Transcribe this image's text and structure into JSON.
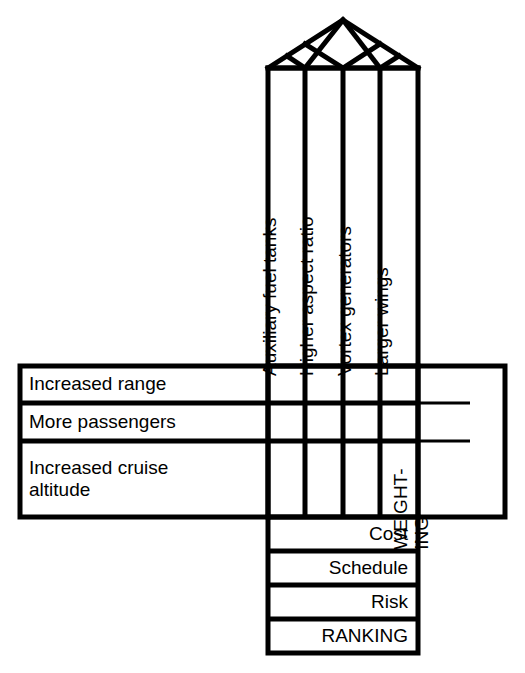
{
  "diagram": {
    "type": "house-of-quality",
    "title": "",
    "roof": {
      "name": "correlation-roof",
      "cells_empty": true,
      "diamond_count": 6
    },
    "columns": {
      "header": "",
      "items": [
        {
          "label": "Auxiliary fuel tanks"
        },
        {
          "label": "Higher aspect ratio"
        },
        {
          "label": "Vortex generators"
        },
        {
          "label": "Larger wings"
        }
      ]
    },
    "rows": {
      "header": "",
      "items": [
        {
          "label": "Increased range"
        },
        {
          "label": "More passengers"
        },
        {
          "label": "Increased cruise\naltitude"
        }
      ]
    },
    "weighting": {
      "label": "WEIGHT-\nING"
    },
    "bottom_rows": [
      {
        "label": "Cost"
      },
      {
        "label": "Schedule"
      },
      {
        "label": "Risk"
      },
      {
        "label": "RANKING"
      }
    ],
    "matrix": {
      "values": [
        [
          "",
          "",
          "",
          ""
        ],
        [
          "",
          "",
          "",
          ""
        ],
        [
          "",
          "",
          "",
          ""
        ]
      ]
    },
    "colors": {
      "line": "#000000",
      "background": "#ffffff",
      "text": "#000000"
    }
  }
}
